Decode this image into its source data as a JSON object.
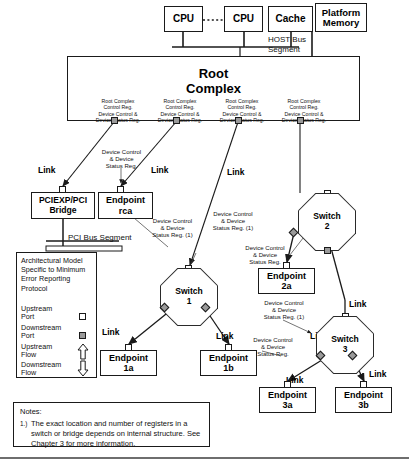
{
  "host": {
    "cpu1": "CPU",
    "cpu2": "CPU",
    "cache": "Cache",
    "platform_memory": "Platform\nMemory",
    "bus_segment_label": "HOST Bus\nSegment"
  },
  "root_complex": {
    "title": "Root\nComplex",
    "registers": [
      "Root Complex\nControl Reg.\nDevice Control &\nDevice Status Reg.",
      "Root Complex\nControl Reg.\nDevice Control &\nDevice Status Reg.",
      "Root Complex\nControl Reg.\nDevice Control &\nDevice Status Reg.",
      "Root Complex\nControl Reg.\nDevice Control &\nDevice Status Reg."
    ]
  },
  "nodes": {
    "bridge": "PCIEXP/PCI\nBridge",
    "endpoint_rca": "Endpoint\nrca",
    "switch1": "Switch\n1",
    "switch2": "Switch\n2",
    "switch3": "Switch\n3",
    "endpoint_1a": "Endpoint\n1a",
    "endpoint_1b": "Endpoint\n1b",
    "endpoint_2a": "Endpoint\n2a",
    "endpoint_3a": "Endpoint\n3a",
    "endpoint_3b": "Endpoint\n3b"
  },
  "segments": {
    "pci_bus": "PCI Bus Segment"
  },
  "link_labels": {
    "l1": "Link",
    "l2": "Link",
    "l3": "Link",
    "l4": "Link",
    "l5": "Link",
    "l6": "Link",
    "l7": "Link",
    "l8": "Link",
    "l9": "Link",
    "l10": "Link"
  },
  "annotations": {
    "a_bridge_ep": "Device Control\n& Device\nStatus Reg.",
    "a_bridge_note": "Device Control\n& Device\nStatus Reg. (1)",
    "a_sw1_top": "Device Control\n& Device\nStatus Reg. (1)",
    "a_sw2_left": "Device Control\n& Device\nStatus Reg.",
    "a_sw3_left": "Device Control\n& Device\nStatus Reg. (1)",
    "a_ep1b": "Device Control\n& Device\nStatus Reg."
  },
  "legend": {
    "title": "Architectural Model\nSpecific to Minimum\nError Reporting\nProtocol",
    "items": [
      {
        "label": "Upstream\nPort",
        "icon": "upstream-port-square"
      },
      {
        "label": "Downstream\nPort",
        "icon": "downstream-port-square"
      },
      {
        "label": "Upstream\nFlow",
        "icon": "up-arrow"
      },
      {
        "label": "Downstream\nFlow",
        "icon": "down-arrow"
      }
    ]
  },
  "notes": {
    "heading": "Notes:",
    "number": "1.)",
    "text": "The exact location and number of registers in a switch or bridge depends on internal structure. See Chapter 3 for more information."
  },
  "colors": {
    "stroke": "#1a1a1a",
    "downstream_port_fill": "#9a9a9a",
    "upstream_port_fill": "#ffffff",
    "background": "#ffffff",
    "rule": "#6e6e6e"
  }
}
